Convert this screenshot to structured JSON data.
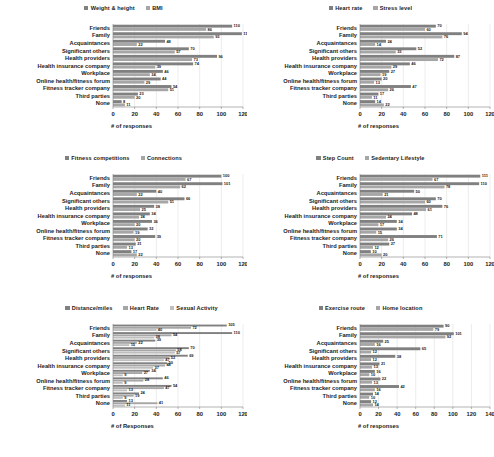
{
  "figure": {
    "categories": [
      "Friends",
      "Family",
      "Acquaintances",
      "Significant others",
      "Health providers",
      "Health insurance company",
      "Workplace",
      "Online health/fitness forum",
      "Fitness tracker company",
      "Third parties",
      "None"
    ],
    "colors": {
      "series1": "#808080",
      "series2": "#a6a6a6",
      "series3": "#bfbfbf",
      "gridline": "#d9d9d9",
      "axis": "#808080",
      "text": "#1a1a1a"
    }
  },
  "chart_data": [
    {
      "type": "bar",
      "orientation": "horizontal",
      "title": "",
      "xlabel": "# of responses",
      "ylabel": "",
      "xlim": [
        0,
        120
      ],
      "xticks": [
        0,
        20,
        40,
        60,
        80,
        100,
        120
      ],
      "grid": true,
      "legend_position": "top-center",
      "categories": [
        "Friends",
        "Family",
        "Acquaintances",
        "Significant others",
        "Health providers",
        "Health insurance company",
        "Workplace",
        "Online health/fitness forum",
        "Fitness tracker company",
        "Third parties",
        "None"
      ],
      "series": [
        {
          "name": "Weight & height",
          "color": "#808080",
          "values": [
            110,
            119,
            48,
            70,
            96,
            74,
            46,
            44,
            54,
            23,
            8
          ]
        },
        {
          "name": "BMI",
          "color": "#a6a6a6",
          "values": [
            86,
            93,
            22,
            57,
            73,
            39,
            34,
            29,
            51,
            20,
            11
          ]
        }
      ]
    },
    {
      "type": "bar",
      "orientation": "horizontal",
      "title": "",
      "xlabel": "# of responses",
      "ylabel": "",
      "xlim": [
        0,
        120
      ],
      "xticks": [
        0,
        20,
        40,
        60,
        80,
        100,
        120
      ],
      "grid": true,
      "legend_position": "top-center",
      "categories": [
        "Friends",
        "Family",
        "Acquaintances",
        "Significant others",
        "Health providers",
        "Health insurance company",
        "Workplace",
        "Online health/fitness forum",
        "Fitness tracker company",
        "Third parties",
        "None"
      ],
      "series": [
        {
          "name": "Heart rate",
          "color": "#808080",
          "values": [
            70,
            94,
            24,
            52,
            87,
            46,
            27,
            20,
            47,
            17,
            14
          ]
        },
        {
          "name": "Stress level",
          "color": "#a6a6a6",
          "values": [
            60,
            76,
            14,
            33,
            72,
            29,
            19,
            13,
            26,
            11,
            22
          ]
        }
      ]
    },
    {
      "type": "bar",
      "orientation": "horizontal",
      "title": "",
      "xlabel": "# of responses",
      "ylabel": "",
      "xlim": [
        0,
        120
      ],
      "xticks": [
        0,
        20,
        40,
        60,
        80,
        100,
        120
      ],
      "grid": true,
      "legend_position": "top-center",
      "categories": [
        "Friends",
        "Family",
        "Acquaintances",
        "Significant others",
        "Health providers",
        "Health insurance company",
        "Workplace",
        "Online health/fitness forum",
        "Fitness tracker company",
        "Third parties",
        "None"
      ],
      "series": [
        {
          "name": "Fitness competitions",
          "color": "#808080",
          "values": [
            100,
            101,
            40,
            66,
            38,
            34,
            36,
            32,
            39,
            21,
            17
          ]
        },
        {
          "name": "Connections",
          "color": "#a6a6a6",
          "values": [
            67,
            62,
            22,
            51,
            25,
            24,
            20,
            19,
            20,
            13,
            22
          ]
        }
      ]
    },
    {
      "type": "bar",
      "orientation": "horizontal",
      "title": "",
      "xlabel": "# of responses",
      "ylabel": "",
      "xlim": [
        0,
        120
      ],
      "xticks": [
        0,
        20,
        40,
        60,
        80,
        100,
        120
      ],
      "grid": true,
      "legend_position": "top-center",
      "categories": [
        "Friends",
        "Family",
        "Acquaintances",
        "Significant others",
        "Health providers",
        "Health insurance company",
        "Workplace",
        "Online health/fitness forum",
        "Fitness tracker company",
        "Third parties",
        "None"
      ],
      "series": [
        {
          "name": "Step Count",
          "color": "#808080",
          "values": [
            111,
            110,
            50,
            70,
            76,
            48,
            34,
            34,
            71,
            27,
            10
          ]
        },
        {
          "name": "Sedentary Lifestyle",
          "color": "#a6a6a6",
          "values": [
            67,
            78,
            21,
            60,
            61,
            24,
            17,
            15,
            26,
            12,
            20
          ]
        }
      ]
    },
    {
      "type": "bar",
      "orientation": "horizontal",
      "title": "",
      "xlabel": "# of Responses",
      "ylabel": "",
      "xlim": [
        0,
        120
      ],
      "xticks": [
        0,
        20,
        40,
        60,
        80,
        100,
        120
      ],
      "grid": true,
      "legend_position": "top-center",
      "categories": [
        "Friends",
        "Family",
        "Acquaintances",
        "Significant others",
        "Health providers",
        "Health insurance company",
        "Workplace",
        "Online health/fitness forum",
        "Fitness tracker company",
        "Third parties",
        "None"
      ],
      "series": [
        {
          "name": "Distance/miles",
          "color": "#808080",
          "values": [
            105,
            110,
            39,
            70,
            69,
            50,
            34,
            46,
            54,
            24,
            13
          ]
        },
        {
          "name": "Heart Rate",
          "color": "#a6a6a6",
          "values": [
            72,
            54,
            22,
            58,
            52,
            48,
            27,
            28,
            47,
            19,
            41
          ]
        },
        {
          "name": "Sexual Activity",
          "color": "#bfbfbf",
          "values": [
            40,
            38,
            15,
            57,
            47,
            37,
            9,
            9,
            13,
            9,
            11
          ]
        }
      ]
    },
    {
      "type": "bar",
      "orientation": "horizontal",
      "title": "",
      "xlabel": "# of responses",
      "ylabel": "",
      "xlim": [
        0,
        140
      ],
      "xticks": [
        0,
        20,
        40,
        60,
        80,
        100,
        120,
        140
      ],
      "grid": true,
      "legend_position": "top-center",
      "categories": [
        "Friends",
        "Family",
        "Acquaintances",
        "Significant others",
        "Health providers",
        "Health insurance company",
        "Workplace",
        "Online health/fitness forum",
        "Fitness tracker company",
        "Third parties",
        "None"
      ],
      "series": [
        {
          "name": "Exercise route",
          "color": "#808080",
          "values": [
            90,
            101,
            25,
            65,
            38,
            21,
            16,
            22,
            42,
            14,
            12
          ]
        },
        {
          "name": "Home location",
          "color": "#a6a6a6",
          "values": [
            79,
            92,
            16,
            12,
            12,
            13,
            10,
            13,
            16,
            10,
            14
          ]
        }
      ]
    }
  ]
}
